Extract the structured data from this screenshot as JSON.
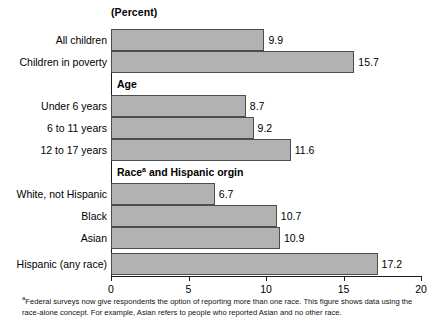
{
  "chart_data": {
    "type": "bar",
    "orientation": "horizontal",
    "title": "",
    "unit_caption": "(Percent)",
    "xlabel": "",
    "ylabel": "",
    "xlim": [
      0,
      20
    ],
    "xticks": [
      0,
      5,
      10,
      15,
      20
    ],
    "xtick_labels": [
      "0",
      "5",
      "10",
      "15",
      "20"
    ],
    "grid": false,
    "legend": "none",
    "bar_color": "#b2b2b2",
    "bar_border_color": "#4d4d4d",
    "groups": [
      {
        "header": null,
        "rows": [
          {
            "label": "All children",
            "value": 9.9,
            "value_label": "9.9"
          },
          {
            "label": "Children in poverty",
            "value": 15.7,
            "value_label": "15.7"
          }
        ]
      },
      {
        "header": "Age",
        "header_superscript": "",
        "rows": [
          {
            "label": "Under 6 years",
            "value": 8.7,
            "value_label": "8.7"
          },
          {
            "label": "6 to 11 years",
            "value": 9.2,
            "value_label": "9.2"
          },
          {
            "label": "12 to 17 years",
            "value": 11.6,
            "value_label": "11.6"
          }
        ]
      },
      {
        "header": "Race",
        "header_superscript": "a",
        "header_rest": " and Hispanic orgin",
        "rows": [
          {
            "label": "White, not Hispanic",
            "value": 6.7,
            "value_label": "6.7"
          },
          {
            "label": "Black",
            "value": 10.7,
            "value_label": "10.7"
          },
          {
            "label": "Asian",
            "value": 10.9,
            "value_label": "10.9"
          },
          {
            "label": "Hispanic (any race)",
            "value": 17.2,
            "value_label": "17.2"
          }
        ]
      }
    ],
    "categories": [
      "All children",
      "Children in poverty",
      "Under 6 years",
      "6 to 11 years",
      "12 to 17 years",
      "White, not Hispanic",
      "Black",
      "Asian",
      "Hispanic (any race)"
    ],
    "values": [
      9.9,
      15.7,
      8.7,
      9.2,
      11.6,
      6.7,
      10.7,
      10.9,
      17.2
    ]
  },
  "footnote": {
    "marker": "a",
    "text": "Federal surveys now give respondents the option of reporting more than one race. This figure shows data using the race-alone concept. For example, Asian refers to people who reported Asian and no other race."
  }
}
